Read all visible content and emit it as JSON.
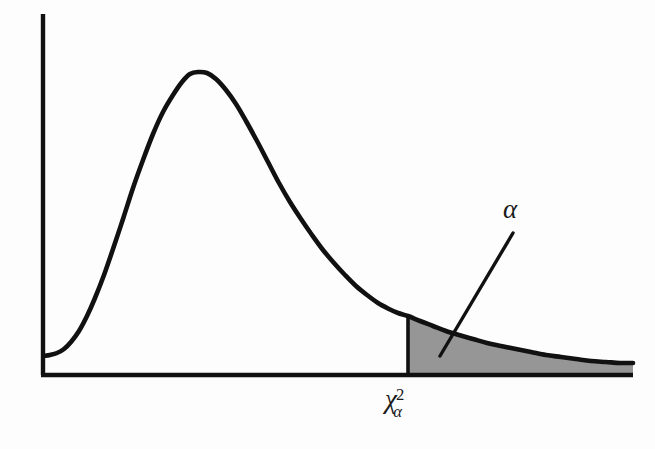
{
  "figure": {
    "background_color": "#fdfdfd",
    "curve_color": "#111111",
    "axis_color": "#111111",
    "shade_color": "#969696"
  },
  "labels": {
    "critical_value": {
      "base": "χ",
      "superscript": "2",
      "subscript": "α",
      "full": "χ²α"
    },
    "tail_area": {
      "text": "α"
    }
  },
  "chart_data": {
    "type": "line",
    "title": "",
    "subtitle": "",
    "xlabel": "χ²α",
    "ylabel": "",
    "grid": false,
    "legend": null,
    "axis_ranges": {
      "x_pixel": [
        43,
        633
      ],
      "y_pixel": [
        375,
        14
      ]
    },
    "annotations": [
      {
        "text": "χ²α",
        "role": "x-axis-critical-value-tick",
        "x_pixel": 405,
        "y_pixel": 408
      },
      {
        "text": "α",
        "role": "shaded-tail-area-label",
        "x_pixel": 513,
        "y_pixel": 213
      }
    ],
    "leader_line": {
      "from_pixel": [
        513,
        233
      ],
      "to_pixel": [
        440,
        356
      ]
    },
    "critical_value_x_pixel": 408,
    "shaded_region": {
      "from_x_pixel": 408,
      "to_x_pixel": 633,
      "fill": "#969696",
      "area_meaning": "α"
    },
    "curve_points_pixel": [
      [
        44,
        356
      ],
      [
        50,
        355
      ],
      [
        57,
        353
      ],
      [
        64,
        349
      ],
      [
        71,
        342
      ],
      [
        79,
        331
      ],
      [
        87,
        316
      ],
      [
        95,
        298
      ],
      [
        104,
        275
      ],
      [
        113,
        249
      ],
      [
        123,
        219
      ],
      [
        133,
        188
      ],
      [
        143,
        160
      ],
      [
        153,
        134
      ],
      [
        163,
        112
      ],
      [
        173,
        95
      ],
      [
        182,
        82
      ],
      [
        190,
        74
      ],
      [
        198,
        72
      ],
      [
        207,
        73
      ],
      [
        216,
        79
      ],
      [
        226,
        90
      ],
      [
        236,
        104
      ],
      [
        246,
        121
      ],
      [
        257,
        141
      ],
      [
        268,
        162
      ],
      [
        279,
        183
      ],
      [
        290,
        202
      ],
      [
        301,
        219
      ],
      [
        312,
        235
      ],
      [
        323,
        250
      ],
      [
        334,
        263
      ],
      [
        345,
        275
      ],
      [
        356,
        286
      ],
      [
        367,
        295
      ],
      [
        378,
        303
      ],
      [
        389,
        309
      ],
      [
        398,
        313
      ],
      [
        408,
        316
      ],
      [
        420,
        321
      ],
      [
        433,
        326
      ],
      [
        446,
        331
      ],
      [
        459,
        335
      ],
      [
        473,
        339
      ],
      [
        487,
        343
      ],
      [
        501,
        346
      ],
      [
        516,
        349
      ],
      [
        531,
        352
      ],
      [
        546,
        355
      ],
      [
        561,
        357
      ],
      [
        576,
        359
      ],
      [
        591,
        361
      ],
      [
        606,
        362
      ],
      [
        620,
        363
      ],
      [
        633,
        363
      ]
    ]
  }
}
